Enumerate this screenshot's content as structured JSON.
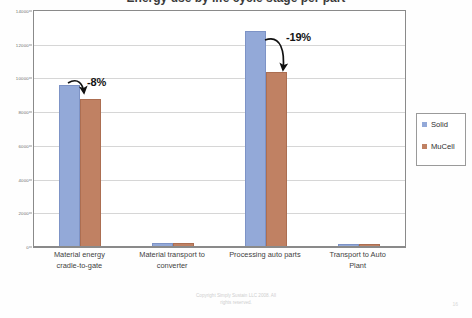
{
  "slide": {
    "title_partial": "Energy use by life cycle stage per part",
    "page_number": "16",
    "footer_line1": "Copyright Simply Sustain LLC 2008. All",
    "footer_line2": "rights reserved."
  },
  "legend": {
    "position": "right",
    "items": [
      {
        "label": "Solid",
        "color": "#93a9d8",
        "swatch_name": "solid-swatch"
      },
      {
        "label": "MuCell",
        "color": "#c08163",
        "swatch_name": "mucell-swatch"
      }
    ]
  },
  "annotations": [
    {
      "text": "-8%",
      "target_group": "Material energy cradle-to-gate"
    },
    {
      "text": "-19%",
      "target_group": "Processing auto parts"
    }
  ],
  "axis": {
    "y_ticks": [
      "0",
      "2000",
      "4000",
      "6000",
      "8000",
      "10000",
      "12000",
      "14000"
    ]
  },
  "chart_data": {
    "type": "bar",
    "title": "Energy use by life cycle stage per part",
    "xlabel": "",
    "ylabel": "",
    "ylim": [
      0,
      14000
    ],
    "ytick_interval": 2000,
    "grid": true,
    "legend_position": "right",
    "categories": [
      "Material energy cradle-to-gate",
      "Material transport to converter",
      "Processing auto parts",
      "Transport to Auto Plant"
    ],
    "category_lines": [
      [
        "Material energy",
        "cradle-to-gate"
      ],
      [
        "Material transport to",
        "converter"
      ],
      [
        "Processing auto parts",
        ""
      ],
      [
        "Transport to Auto",
        "Plant"
      ]
    ],
    "series": [
      {
        "name": "Solid",
        "color": "#93a9d8",
        "values": [
          9600,
          250,
          12800,
          180
        ]
      },
      {
        "name": "MuCell",
        "color": "#c08163",
        "values": [
          8800,
          250,
          10400,
          180
        ]
      }
    ],
    "annotations": [
      {
        "text": "-8%",
        "category": "Material energy cradle-to-gate",
        "from": 9600,
        "to": 8800
      },
      {
        "text": "-19%",
        "category": "Processing auto parts",
        "from": 12800,
        "to": 10400
      }
    ]
  }
}
